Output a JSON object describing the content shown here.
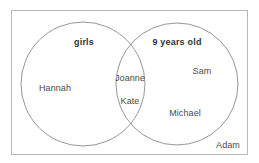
{
  "diagram": {
    "type": "venn",
    "kind": "two-set-venn-diagram",
    "universe_label": "",
    "colors": {
      "background": "#ffffff",
      "frame_border": "#b9b9b9",
      "circle_stroke": "#8a8a8a",
      "member_text": "#4a4a4a",
      "set_title_text": "#333333"
    },
    "frame": {
      "name": "universe-rectangle",
      "x": 11,
      "y": 10,
      "width": 237,
      "height": 145
    },
    "sets": [
      {
        "id": "girls",
        "label": "girls",
        "cx": 83,
        "cy": 84,
        "r": 62,
        "label_x": 84,
        "label_y": 42
      },
      {
        "id": "nine-years-old",
        "label": "9 years old",
        "cx": 177,
        "cy": 84,
        "r": 61,
        "label_x": 177,
        "label_y": 42
      }
    ],
    "members": [
      {
        "name": "Hannah",
        "region": "girls-only",
        "x": 55,
        "y": 88
      },
      {
        "name": "Joanne",
        "region": "intersection",
        "x": 130,
        "y": 78
      },
      {
        "name": "Kate",
        "region": "intersection",
        "x": 130,
        "y": 101
      },
      {
        "name": "Sam",
        "region": "nine-years-only",
        "x": 202,
        "y": 71
      },
      {
        "name": "Michael",
        "region": "nine-years-only",
        "x": 185,
        "y": 113
      },
      {
        "name": "Adam",
        "region": "outside-both",
        "x": 228,
        "y": 145
      }
    ]
  }
}
